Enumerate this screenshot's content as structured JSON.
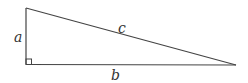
{
  "diagram": {
    "type": "right-triangle",
    "labels": {
      "leg_vertical": "a",
      "hypotenuse": "c",
      "leg_horizontal": "b"
    },
    "vertices": {
      "top": [
        26,
        8
      ],
      "right_angle": [
        26,
        64
      ],
      "far": [
        235,
        65
      ]
    },
    "right_angle_marker": true,
    "stroke_color": "#444444"
  }
}
